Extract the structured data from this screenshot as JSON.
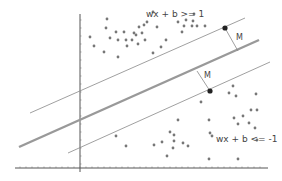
{
  "diagram": {
    "type": "svm-margin",
    "labels": {
      "upper_constraint": "wx + b >= 1",
      "lower_constraint": "wx + b <= -1",
      "margin_upper": "M",
      "margin_lower": "M"
    },
    "colors": {
      "points": "#777777",
      "support_vector": "#222222",
      "hyperplane": "#999999",
      "margin_lines": "#888888",
      "axes": "#555555"
    },
    "class_positive_points": [
      [
        107,
        19
      ],
      [
        94,
        46
      ],
      [
        106,
        28
      ],
      [
        116,
        32
      ],
      [
        124,
        32
      ],
      [
        134,
        33
      ],
      [
        90,
        37
      ],
      [
        110,
        38
      ],
      [
        118,
        40
      ],
      [
        126,
        40
      ],
      [
        132,
        40
      ],
      [
        136,
        35
      ],
      [
        139,
        27
      ],
      [
        138,
        44
      ],
      [
        145,
        40
      ],
      [
        142,
        33
      ],
      [
        144,
        25
      ],
      [
        147,
        22
      ],
      [
        153,
        12
      ],
      [
        157,
        27
      ],
      [
        166,
        40
      ],
      [
        178,
        22
      ],
      [
        182,
        32
      ],
      [
        184,
        26
      ],
      [
        192,
        26
      ],
      [
        193,
        21
      ],
      [
        186,
        20
      ],
      [
        197,
        26
      ],
      [
        194,
        14
      ],
      [
        205,
        26
      ],
      [
        104,
        52
      ],
      [
        118,
        57
      ],
      [
        127,
        46
      ],
      [
        161,
        47
      ],
      [
        153,
        53
      ]
    ],
    "class_negative_points": [
      [
        229,
        93
      ],
      [
        236,
        96
      ],
      [
        233,
        86
      ],
      [
        256,
        94
      ],
      [
        251,
        110
      ],
      [
        243,
        116
      ],
      [
        238,
        124
      ],
      [
        234,
        118
      ],
      [
        257,
        110
      ],
      [
        249,
        123
      ],
      [
        201,
        102
      ],
      [
        178,
        120
      ],
      [
        174,
        135
      ],
      [
        209,
        120
      ],
      [
        170,
        132
      ],
      [
        173,
        148
      ],
      [
        174,
        141
      ],
      [
        162,
        142
      ],
      [
        154,
        145
      ],
      [
        167,
        156
      ],
      [
        183,
        143
      ],
      [
        188,
        146
      ],
      [
        210,
        133
      ],
      [
        212,
        136
      ],
      [
        209,
        159
      ],
      [
        238,
        159
      ],
      [
        257,
        140
      ],
      [
        255,
        128
      ],
      [
        116,
        136
      ],
      [
        126,
        146
      ]
    ],
    "support_vectors": [
      [
        225,
        28
      ],
      [
        210,
        91
      ]
    ]
  }
}
